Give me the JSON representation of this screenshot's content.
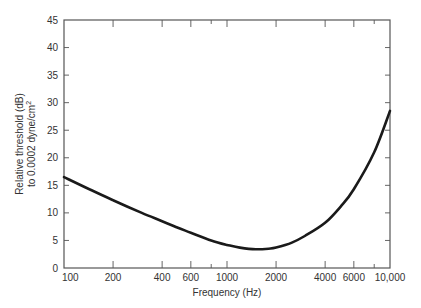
{
  "chart_data": {
    "type": "line",
    "title": "",
    "xlabel": "Frequency (Hz)",
    "ylabel_line1": "Relative threshold (dB)",
    "ylabel_line2": "to 0.0002 dyne/cm",
    "ylabel_superscript": "2",
    "xscale": "log",
    "xlim": [
      100,
      10000
    ],
    "ylim": [
      0,
      45
    ],
    "grid": false,
    "legend": null,
    "x_ticks": [
      100,
      200,
      400,
      600,
      1000,
      2000,
      4000,
      6000,
      10000
    ],
    "x_tick_labels": [
      "100",
      "200",
      "400",
      "600",
      "1000",
      "2000",
      "4000",
      "6000",
      "10,000"
    ],
    "x_minor_ticks": [
      800,
      8000
    ],
    "y_ticks": [
      0,
      5,
      10,
      15,
      20,
      25,
      30,
      35,
      40,
      45
    ],
    "y_tick_labels": [
      "0",
      "5",
      "10",
      "15",
      "20",
      "25",
      "30",
      "35",
      "40",
      "45"
    ],
    "series": [
      {
        "name": "Relative threshold",
        "x": [
          100,
          150,
          200,
          300,
          400,
          500,
          600,
          800,
          1000,
          1200,
          1500,
          1800,
          2000,
          2500,
          3000,
          4000,
          5000,
          6000,
          8000,
          10000
        ],
        "y": [
          16.5,
          14.0,
          12.3,
          10.0,
          8.5,
          7.3,
          6.4,
          5.0,
          4.2,
          3.7,
          3.4,
          3.5,
          3.7,
          4.6,
          5.8,
          8.2,
          11.2,
          14.3,
          21.0,
          28.5
        ]
      }
    ]
  },
  "colors": {
    "line": "#1a1a1a",
    "axis": "#555555",
    "text": "#333333"
  }
}
